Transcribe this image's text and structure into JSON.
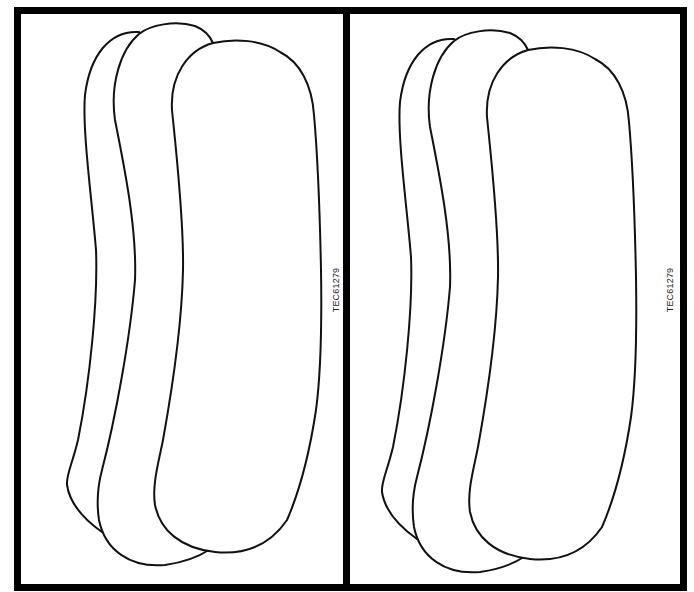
{
  "figure": {
    "panels": [
      {
        "position": "left",
        "label": "TEC61279",
        "shapes": [
          "back-shape",
          "middle-shape",
          "front-shape"
        ]
      },
      {
        "position": "right",
        "label": "TEC61279",
        "shapes": [
          "back-shape",
          "middle-shape",
          "front-shape"
        ]
      }
    ],
    "colors": {
      "border": "#000000",
      "stroke": "#111111",
      "fill": "#ffffff"
    }
  }
}
